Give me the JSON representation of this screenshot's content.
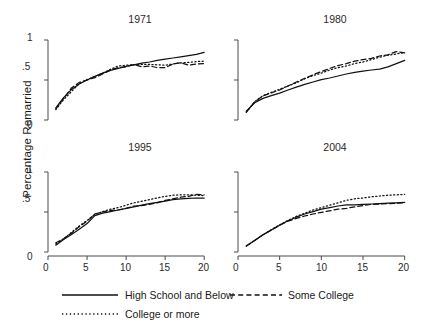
{
  "chart_data": {
    "type": "line",
    "title": "",
    "xlabel": "",
    "ylabel": "Percentage Remarried",
    "xlim": [
      0,
      21
    ],
    "ylim": [
      -0.05,
      1.05
    ],
    "xticks": [
      0,
      5,
      10,
      15,
      20
    ],
    "xtick_labels": [
      "0",
      "5",
      "10",
      "15",
      "20"
    ],
    "yticks": [
      0,
      0.5,
      1
    ],
    "ytick_labels": [
      "0",
      ".5",
      "1"
    ],
    "grid": false,
    "legend_position": "bottom",
    "legend": [
      {
        "name": "High School and Below",
        "style": "solid"
      },
      {
        "name": "Some College",
        "style": "dashed"
      },
      {
        "name": "College or more",
        "style": "dash-dot"
      }
    ],
    "panels": [
      {
        "title": "1971",
        "row": 0,
        "col": 0,
        "x": [
          1,
          2,
          3,
          4,
          5,
          6,
          7,
          8,
          9,
          10,
          11,
          12,
          13,
          14,
          15,
          16,
          17,
          18,
          19,
          20
        ],
        "series": [
          {
            "name": "High School and Below",
            "style": "solid",
            "values": [
              0.15,
              0.28,
              0.38,
              0.45,
              0.5,
              0.545,
              0.585,
              0.62,
              0.645,
              0.67,
              0.69,
              0.71,
              0.725,
              0.745,
              0.76,
              0.775,
              0.79,
              0.805,
              0.82,
              0.845
            ]
          },
          {
            "name": "Some College",
            "style": "dashed",
            "values": [
              0.14,
              0.27,
              0.4,
              0.47,
              0.5,
              0.53,
              0.575,
              0.625,
              0.655,
              0.665,
              0.695,
              0.665,
              0.675,
              0.655,
              0.655,
              0.7,
              0.715,
              0.685,
              0.7,
              0.705
            ]
          },
          {
            "name": "College or more",
            "style": "dash-dot",
            "values": [
              0.13,
              0.255,
              0.355,
              0.455,
              0.505,
              0.545,
              0.585,
              0.635,
              0.675,
              0.685,
              0.69,
              0.695,
              0.695,
              0.69,
              0.685,
              0.7,
              0.715,
              0.72,
              0.73,
              0.735
            ]
          }
        ]
      },
      {
        "title": "1980",
        "row": 0,
        "col": 1,
        "x": [
          1,
          2,
          3,
          4,
          5,
          6,
          7,
          8,
          9,
          10,
          11,
          12,
          13,
          14,
          15,
          16,
          17,
          18,
          19,
          20
        ],
        "series": [
          {
            "name": "High School and Below",
            "style": "solid",
            "values": [
              0.11,
              0.215,
              0.27,
              0.305,
              0.335,
              0.375,
              0.41,
              0.445,
              0.475,
              0.505,
              0.525,
              0.55,
              0.575,
              0.595,
              0.61,
              0.625,
              0.635,
              0.665,
              0.705,
              0.745
            ]
          },
          {
            "name": "Some College",
            "style": "dashed",
            "values": [
              0.1,
              0.225,
              0.3,
              0.34,
              0.375,
              0.425,
              0.475,
              0.52,
              0.565,
              0.605,
              0.645,
              0.68,
              0.705,
              0.735,
              0.755,
              0.77,
              0.8,
              0.815,
              0.855,
              0.84
            ]
          },
          {
            "name": "College or more",
            "style": "dash-dot",
            "values": [
              0.095,
              0.23,
              0.305,
              0.345,
              0.385,
              0.425,
              0.465,
              0.515,
              0.555,
              0.585,
              0.625,
              0.655,
              0.675,
              0.705,
              0.725,
              0.755,
              0.785,
              0.81,
              0.825,
              0.845
            ]
          }
        ]
      },
      {
        "title": "1995",
        "row": 1,
        "col": 0,
        "x": [
          1,
          2,
          3,
          4,
          5,
          6,
          7,
          8,
          9,
          10,
          11,
          12,
          13,
          14,
          15,
          16,
          17,
          18,
          19,
          20
        ],
        "series": [
          {
            "name": "High School and Below",
            "style": "solid",
            "values": [
              0.085,
              0.155,
              0.22,
              0.285,
              0.355,
              0.455,
              0.485,
              0.505,
              0.525,
              0.545,
              0.565,
              0.585,
              0.605,
              0.62,
              0.635,
              0.655,
              0.665,
              0.67,
              0.675,
              0.675
            ]
          },
          {
            "name": "Some College",
            "style": "dashed",
            "values": [
              0.115,
              0.165,
              0.235,
              0.315,
              0.385,
              0.475,
              0.5,
              0.52,
              0.525,
              0.545,
              0.575,
              0.58,
              0.595,
              0.615,
              0.645,
              0.665,
              0.685,
              0.695,
              0.72,
              0.715
            ]
          },
          {
            "name": "College or more",
            "style": "dash-dot",
            "values": [
              0.1,
              0.165,
              0.245,
              0.325,
              0.395,
              0.47,
              0.505,
              0.535,
              0.555,
              0.585,
              0.615,
              0.635,
              0.655,
              0.675,
              0.695,
              0.71,
              0.715,
              0.715,
              0.71,
              0.705
            ]
          }
        ]
      },
      {
        "title": "2004",
        "row": 1,
        "col": 1,
        "x": [
          1,
          2,
          3,
          4,
          5,
          6,
          7,
          8,
          9,
          10,
          11,
          12,
          13,
          14,
          15,
          16,
          17,
          18,
          19,
          20
        ],
        "series": [
          {
            "name": "High School and Below",
            "style": "solid",
            "values": [
              0.075,
              0.145,
              0.215,
              0.275,
              0.335,
              0.39,
              0.435,
              0.475,
              0.505,
              0.535,
              0.555,
              0.575,
              0.59,
              0.59,
              0.595,
              0.6,
              0.605,
              0.61,
              0.615,
              0.62
            ]
          },
          {
            "name": "Some College",
            "style": "dashed",
            "values": [
              0.075,
              0.145,
              0.215,
              0.275,
              0.335,
              0.385,
              0.42,
              0.45,
              0.475,
              0.495,
              0.515,
              0.535,
              0.545,
              0.565,
              0.58,
              0.595,
              0.6,
              0.605,
              0.61,
              0.615
            ]
          },
          {
            "name": "College or more",
            "style": "dash-dot",
            "values": [
              0.075,
              0.145,
              0.215,
              0.28,
              0.34,
              0.395,
              0.445,
              0.485,
              0.525,
              0.555,
              0.585,
              0.615,
              0.645,
              0.665,
              0.675,
              0.69,
              0.7,
              0.71,
              0.715,
              0.72
            ]
          }
        ]
      }
    ]
  }
}
